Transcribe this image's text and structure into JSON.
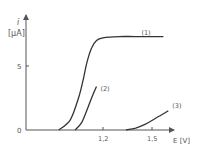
{
  "chart_data": {
    "type": "line",
    "title": "",
    "xlabel": "E [V]",
    "ylabel": "i [µA]",
    "ylabel_symbol": "i",
    "ylabel_unit": "[µA]",
    "x_ticks": [
      {
        "value": 1.2,
        "label": "1,2"
      },
      {
        "value": 1.5,
        "label": "1,5"
      }
    ],
    "y_ticks": [
      {
        "value": 0,
        "label": "0"
      },
      {
        "value": 5,
        "label": "5"
      }
    ],
    "xlim": [
      0.73,
      1.62
    ],
    "ylim": [
      0,
      9
    ],
    "grid": false,
    "legend": "inline labels",
    "series": [
      {
        "name": "(1)",
        "x": [
          0.93,
          1.0,
          1.05,
          1.08,
          1.1,
          1.13,
          1.16,
          1.2,
          1.3,
          1.4,
          1.57
        ],
        "y": [
          0.0,
          0.8,
          2.5,
          4.0,
          5.2,
          6.4,
          7.0,
          7.2,
          7.3,
          7.3,
          7.3
        ]
      },
      {
        "name": "(2)",
        "x": [
          1.03,
          1.07,
          1.1,
          1.13,
          1.16
        ],
        "y": [
          0.0,
          0.6,
          1.5,
          2.5,
          3.4
        ]
      },
      {
        "name": "(3)",
        "x": [
          1.34,
          1.4,
          1.46,
          1.52,
          1.6
        ],
        "y": [
          0.0,
          0.15,
          0.45,
          0.9,
          1.5
        ]
      }
    ]
  },
  "colors": {
    "axis": "#555555",
    "curve": "#333333"
  }
}
